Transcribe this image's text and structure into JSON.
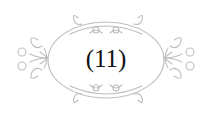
{
  "ornament": {
    "label": "(11)",
    "stroke_color": "#bdbdbd",
    "text_color": "#111111"
  }
}
